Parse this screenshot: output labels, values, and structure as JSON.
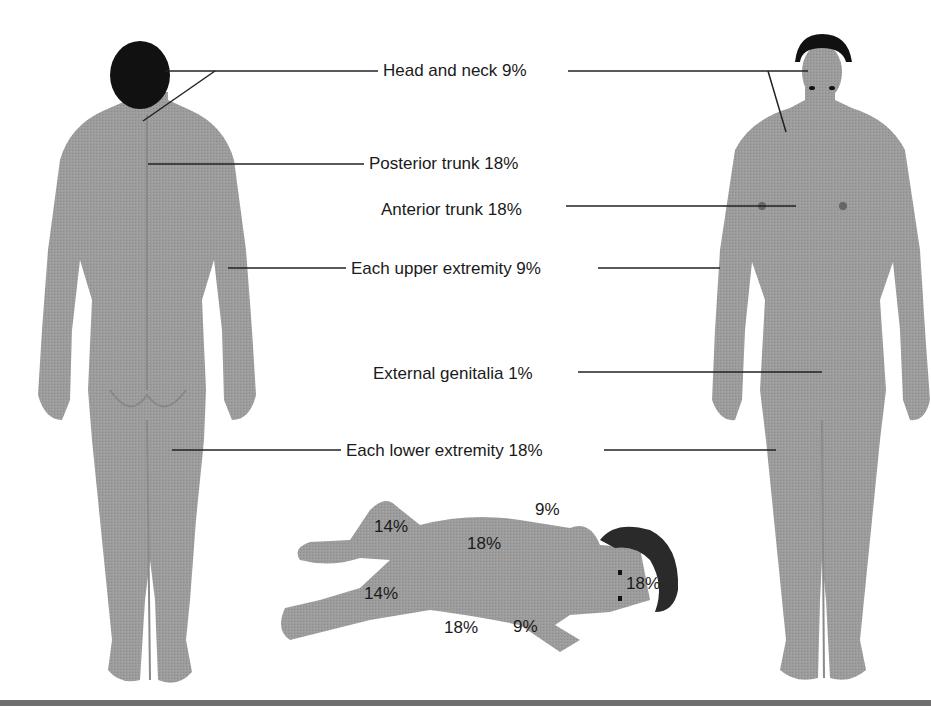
{
  "figure": {
    "colors": {
      "skin": "#9a9a9a",
      "skin_shadow": "#8a8a8a",
      "hair": "#111111",
      "leader_line": "#222222",
      "bottom_rule": "#6e6e6e",
      "text": "#1a1a1a"
    },
    "adult_labels": [
      {
        "id": "head-neck",
        "text": "Head and neck 9%"
      },
      {
        "id": "posterior-trunk",
        "text": "Posterior trunk 18%"
      },
      {
        "id": "anterior-trunk",
        "text": "Anterior trunk 18%"
      },
      {
        "id": "upper-extremity",
        "text": "Each upper extremity 9%"
      },
      {
        "id": "genitalia",
        "text": "External genitalia 1%"
      },
      {
        "id": "lower-extremity",
        "text": "Each lower extremity 18%"
      }
    ],
    "infant_labels": [
      {
        "id": "infant-arm-top",
        "text": "9%"
      },
      {
        "id": "infant-leg-top",
        "text": "14%"
      },
      {
        "id": "infant-trunk",
        "text": "18%"
      },
      {
        "id": "infant-leg-bottom",
        "text": "14%"
      },
      {
        "id": "infant-head",
        "text": "18%"
      },
      {
        "id": "infant-trunk-back",
        "text": "18%"
      },
      {
        "id": "infant-arm-bottom",
        "text": "9%"
      }
    ]
  }
}
